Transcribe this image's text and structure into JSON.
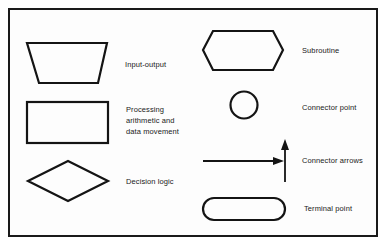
{
  "diagram": {
    "symbols": [
      {
        "shape": "trapezoid",
        "label": "Input-output"
      },
      {
        "shape": "rectangle",
        "label_lines": [
          "Processing",
          "arithmetic and",
          "data movement"
        ]
      },
      {
        "shape": "diamond",
        "label": "Decision logic"
      },
      {
        "shape": "hexagon",
        "label": "Subroutine"
      },
      {
        "shape": "circle",
        "label": "Connector point"
      },
      {
        "shape": "arrows",
        "label": "Connector arrows"
      },
      {
        "shape": "rounded-rectangle",
        "label": "Terminal point"
      }
    ],
    "colors": {
      "stroke": "#141414",
      "background": "#ffffff"
    }
  }
}
